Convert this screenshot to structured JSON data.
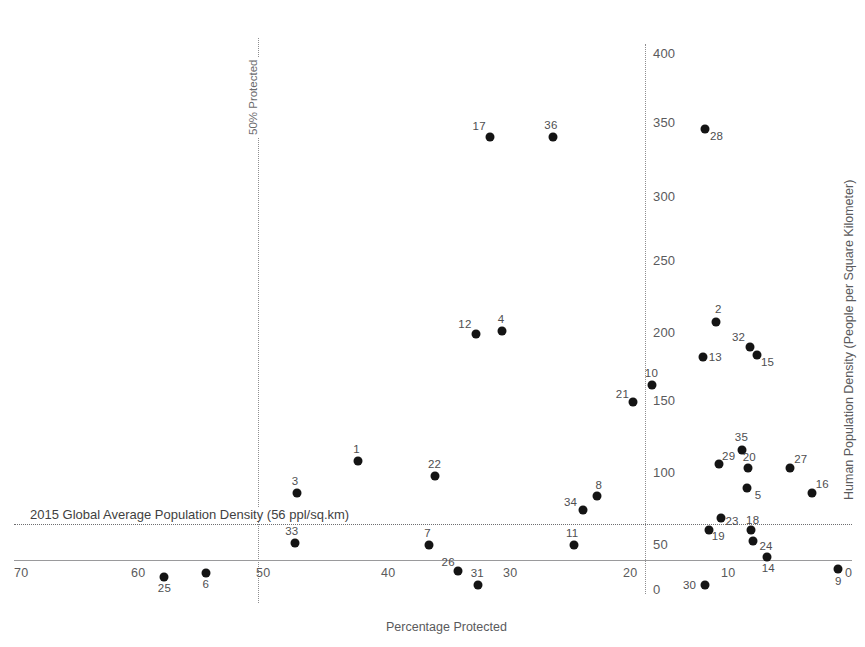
{
  "chart_data": {
    "type": "scatter",
    "title": "",
    "xlabel": "Percentage Protected",
    "ylabel": "Human Population Density (People per Square Kilometer)",
    "xticks": [
      70,
      60,
      50,
      40,
      30,
      20,
      10,
      0
    ],
    "yticks": [
      0,
      50,
      100,
      150,
      200,
      250,
      300,
      350,
      400
    ],
    "xlim": [
      72,
      0
    ],
    "ylim": [
      0,
      415
    ],
    "x_axis_reversed": true,
    "grid": false,
    "legend": "none",
    "annotations": [
      {
        "name": "50% Protected",
        "type": "vertical-reference-line",
        "x": 50
      },
      {
        "name": "2015 Global Average Population Density (56 ppl/sq.km)",
        "type": "horizontal-reference-line",
        "y": 56
      },
      {
        "name": "zero-percent-axis",
        "type": "vertical-reference-line",
        "x": 12
      }
    ],
    "point_label_key": "Country ID",
    "points": [
      {
        "label": "17",
        "x": 30.3,
        "y": 337
      },
      {
        "label": "36",
        "x": 25.0,
        "y": 337
      },
      {
        "label": "28",
        "x": 12.2,
        "y": 343
      },
      {
        "label": "2",
        "x": 11.2,
        "y": 199
      },
      {
        "label": "32",
        "x": 8.4,
        "y": 180
      },
      {
        "label": "15",
        "x": 7.8,
        "y": 174
      },
      {
        "label": "13",
        "x": 12.3,
        "y": 173
      },
      {
        "label": "12",
        "x": 31.5,
        "y": 190
      },
      {
        "label": "4",
        "x": 29.3,
        "y": 192
      },
      {
        "label": "10",
        "x": 16.6,
        "y": 152
      },
      {
        "label": "21",
        "x": 18.2,
        "y": 139
      },
      {
        "label": "35",
        "x": 9.0,
        "y": 103
      },
      {
        "label": "29",
        "x": 11.0,
        "y": 93
      },
      {
        "label": "20",
        "x": 8.5,
        "y": 90
      },
      {
        "label": "27",
        "x": 5.0,
        "y": 90
      },
      {
        "label": "1",
        "x": 41.5,
        "y": 95
      },
      {
        "label": "22",
        "x": 35.0,
        "y": 84
      },
      {
        "label": "5",
        "x": 8.6,
        "y": 75
      },
      {
        "label": "16",
        "x": 3.1,
        "y": 71
      },
      {
        "label": "8",
        "x": 21.3,
        "y": 69
      },
      {
        "label": "34",
        "x": 22.5,
        "y": 58
      },
      {
        "label": "3",
        "x": 46.6,
        "y": 71
      },
      {
        "label": "23",
        "x": 10.8,
        "y": 52
      },
      {
        "label": "19",
        "x": 11.8,
        "y": 43
      },
      {
        "label": "18",
        "x": 8.3,
        "y": 43
      },
      {
        "label": "24",
        "x": 8.1,
        "y": 35
      },
      {
        "label": "33",
        "x": 46.8,
        "y": 34
      },
      {
        "label": "7",
        "x": 35.5,
        "y": 32
      },
      {
        "label": "11",
        "x": 23.2,
        "y": 32
      },
      {
        "label": "14",
        "x": 6.9,
        "y": 23
      },
      {
        "label": "9",
        "x": 0.9,
        "y": 14
      },
      {
        "label": "25",
        "x": 57.8,
        "y": 8
      },
      {
        "label": "6",
        "x": 54.3,
        "y": 11
      },
      {
        "label": "26",
        "x": 33.0,
        "y": 13
      },
      {
        "label": "31",
        "x": 31.3,
        "y": 2
      },
      {
        "label": "30",
        "x": 12.2,
        "y": 2
      }
    ]
  },
  "axes": {
    "x_title": "Percentage Protected",
    "y_title": "Human Population Density (People per Square Kilometer)",
    "x_tick_labels": [
      "70",
      "60",
      "50",
      "40",
      "30",
      "20",
      "10",
      "0"
    ],
    "y_tick_labels": [
      "400",
      "350",
      "300",
      "250",
      "200",
      "150",
      "100",
      "50",
      "0"
    ]
  },
  "reference_lines": {
    "vertical_label": "50% Protected",
    "horizontal_label": "2015 Global Average Population Density (56 ppl/sq.km)"
  },
  "point_labels": [
    "17",
    "36",
    "28",
    "2",
    "32",
    "15",
    "13",
    "12",
    "4",
    "10",
    "21",
    "35",
    "29",
    "20",
    "27",
    "1",
    "22",
    "5",
    "16",
    "8",
    "34",
    "3",
    "23",
    "19",
    "18",
    "24",
    "33",
    "7",
    "11",
    "14",
    "9",
    "25",
    "6",
    "26",
    "31",
    "30"
  ]
}
